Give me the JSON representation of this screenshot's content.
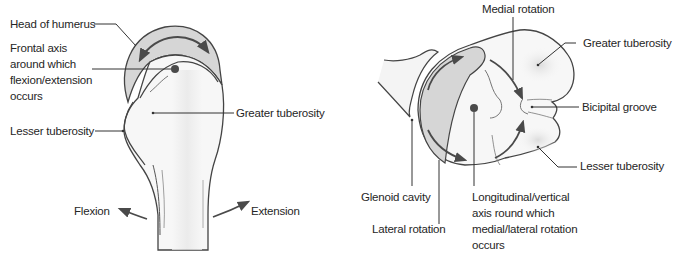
{
  "colors": {
    "outline": "#444444",
    "cartilage_fill": "#d6d6d6",
    "bone_fill": "#f7f7f7",
    "shading": "#e2e2e2",
    "arrow": "#4a4a4a",
    "text": "#262626"
  },
  "left_figure": {
    "view": "humerus-anterior-flexion-extension",
    "labels": {
      "head_of_humerus": "Head of humerus",
      "frontal_axis_line1": "Frontal axis",
      "frontal_axis_line2": "around which",
      "frontal_axis_line3": "flexion/extension",
      "frontal_axis_line4": "occurs",
      "lesser_tuberosity": "Lesser tuberosity",
      "greater_tuberosity": "Greater tuberosity",
      "flexion": "Flexion",
      "extension": "Extension"
    }
  },
  "right_figure": {
    "view": "humerus-superior-medial-lateral-rotation",
    "labels": {
      "medial_rotation": "Medial rotation",
      "greater_tuberosity": "Greater tuberosity",
      "bicipital_groove": "Bicipital groove",
      "lesser_tuberosity": "Lesser tuberosity",
      "glenoid_cavity": "Glenoid cavity",
      "lateral_rotation": "Lateral rotation",
      "longitudinal_axis_line1": "Longitudinal/vertical",
      "longitudinal_axis_line2": "axis round which",
      "longitudinal_axis_line3": "medial/lateral rotation",
      "longitudinal_axis_line4": "occurs"
    }
  }
}
